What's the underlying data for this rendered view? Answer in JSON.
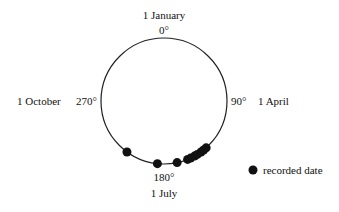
{
  "diagram": {
    "type": "circular-plot",
    "labels": {
      "top_date": "1 January",
      "top_angle": "0°",
      "right_angle": "90°",
      "right_date": "1 April",
      "bottom_angle": "180°",
      "bottom_date": "1 July",
      "left_angle": "270°",
      "left_date": "1 October"
    },
    "legend": {
      "marker": "filled-circle",
      "label": "recorded date"
    },
    "point_color": "#111111",
    "points_deg": [
      138,
      141,
      144,
      148,
      151,
      155,
      158,
      168,
      186,
      216
    ]
  }
}
